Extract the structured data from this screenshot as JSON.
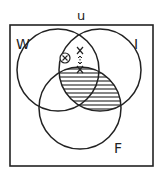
{
  "diagram": {
    "type": "venn",
    "universe_label": "u",
    "sets": [
      {
        "id": "W",
        "label": "W",
        "cx": 58,
        "cy": 70,
        "r": 41
      },
      {
        "id": "I",
        "label": "I",
        "cx": 100,
        "cy": 70,
        "r": 41
      },
      {
        "id": "F",
        "label": "F",
        "cx": 80,
        "cy": 108,
        "r": 41
      }
    ],
    "shaded_region": "I ∩ F",
    "marks": [
      {
        "symbol": "X",
        "circled": true,
        "region": "W only (near W∩I boundary)"
      },
      {
        "symbol": "X",
        "circled": false,
        "region": "W ∩ I, outside F"
      },
      {
        "symbol": "X",
        "circled": false,
        "region": "on boundary of F within W ∩ I"
      }
    ],
    "connector": "dotted line with arrows between the two uncircled X marks",
    "colors": {
      "line": "#222222",
      "shade": "#222222",
      "background": "#ffffff"
    }
  }
}
